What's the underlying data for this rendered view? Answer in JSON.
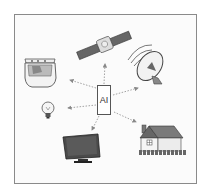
{
  "diagram": {
    "center": {
      "label": "AI"
    },
    "nodes": [
      {
        "id": "washing-machine",
        "label": ""
      },
      {
        "id": "satellite",
        "label": ""
      },
      {
        "id": "satellite-dish",
        "label": ""
      },
      {
        "id": "light-bulb",
        "label": ""
      },
      {
        "id": "monitor",
        "label": ""
      },
      {
        "id": "house",
        "label": ""
      }
    ],
    "edges": [
      {
        "from": "AI",
        "to": "washing-machine",
        "style": "dotted-arrow"
      },
      {
        "from": "AI",
        "to": "satellite",
        "style": "dotted-arrow"
      },
      {
        "from": "AI",
        "to": "satellite-dish",
        "style": "dotted-arrow"
      },
      {
        "from": "AI",
        "to": "light-bulb",
        "style": "dotted-arrow"
      },
      {
        "from": "AI",
        "to": "monitor",
        "style": "dotted-arrow"
      },
      {
        "from": "AI",
        "to": "house",
        "style": "dotted-arrow"
      }
    ],
    "colors": {
      "frame": "#8a8a8a",
      "ink": "#444444",
      "fill_light": "#e8e8e8",
      "fill_dark": "#555555"
    }
  }
}
